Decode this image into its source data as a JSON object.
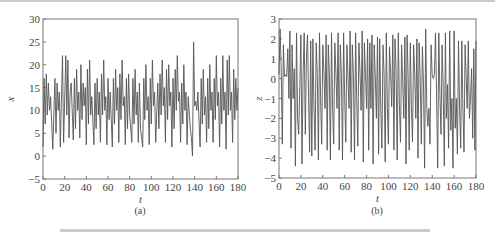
{
  "chart_data": [
    {
      "type": "line",
      "panel_label": "(a)",
      "xlabel": "t",
      "ylabel": "x",
      "xlim": [
        0,
        180
      ],
      "ylim": [
        -5,
        30
      ],
      "xticks": [
        0,
        20,
        40,
        60,
        80,
        100,
        120,
        140,
        160,
        180
      ],
      "yticks": [
        -5,
        0,
        5,
        10,
        15,
        20,
        25,
        30
      ],
      "grid": false,
      "series": [
        {
          "name": "x(t)",
          "t": [
            0,
            1,
            2,
            3,
            4,
            5,
            6,
            7,
            9,
            11,
            12,
            13,
            14,
            15,
            16,
            17,
            18,
            19,
            21,
            22,
            23,
            24,
            25,
            26,
            28,
            29,
            30,
            31,
            32,
            33,
            34,
            35,
            36,
            37,
            38,
            39,
            40,
            41,
            42,
            43,
            44,
            45,
            47,
            48,
            49,
            50,
            51,
            52,
            53,
            54,
            55,
            56,
            57,
            58,
            59,
            60,
            61,
            62,
            64,
            65,
            66,
            67,
            68,
            69,
            70,
            71,
            72,
            73,
            74,
            75,
            76,
            77,
            78,
            79,
            80,
            82,
            83,
            84,
            85,
            86,
            87,
            88,
            89,
            90,
            92,
            93,
            94,
            95,
            96,
            97,
            98,
            99,
            100,
            101,
            102,
            103,
            104,
            106,
            107,
            108,
            109,
            110,
            111,
            112,
            113,
            114,
            115,
            116,
            117,
            118,
            119,
            120,
            121,
            122,
            123,
            124,
            125,
            126,
            127,
            128,
            129,
            130,
            131,
            132,
            133,
            134,
            136,
            137,
            138,
            139,
            140,
            141,
            142,
            143,
            145,
            146,
            147,
            148,
            149,
            150,
            151,
            152,
            153,
            154,
            155,
            156,
            157,
            158,
            159,
            160,
            161,
            162,
            163,
            164,
            165,
            166,
            167,
            168,
            169,
            170,
            171,
            172,
            173,
            174,
            175,
            176,
            177,
            178,
            179,
            180
          ],
          "values": [
            2,
            17,
            7,
            18,
            9,
            16,
            10,
            13,
            1.5,
            17,
            5,
            16,
            10,
            14,
            2,
            12,
            22,
            3,
            22,
            9,
            21,
            4,
            14,
            16,
            3.5,
            17,
            6,
            19,
            10,
            14,
            4,
            20,
            8,
            16,
            11,
            15,
            2.5,
            19,
            7,
            21,
            9,
            13,
            2.5,
            16,
            6,
            17,
            9,
            14,
            3,
            18,
            9,
            21,
            10,
            13,
            2.5,
            17,
            8,
            14,
            2,
            17,
            7,
            19,
            10,
            15,
            3,
            18,
            8,
            21,
            11,
            13,
            2.5,
            17,
            6,
            18,
            9,
            3,
            17,
            7,
            19,
            9,
            14,
            3,
            16,
            6,
            2,
            17,
            8,
            20,
            10,
            13,
            2.5,
            17,
            7,
            21,
            11,
            14,
            3,
            16,
            6,
            18,
            9,
            21,
            11,
            15,
            3,
            19,
            8,
            20,
            11,
            14,
            2,
            17,
            6,
            19,
            10,
            22,
            12,
            14,
            3,
            16,
            7,
            20,
            10,
            14,
            2.5,
            13,
            6,
            4,
            0,
            25,
            11,
            12,
            10,
            14,
            2,
            17,
            7,
            19,
            9,
            13,
            3,
            17,
            6,
            20,
            10,
            14,
            3,
            17,
            8,
            22,
            11,
            14,
            2,
            17,
            7,
            22,
            10,
            14,
            1.5,
            21,
            9,
            22,
            10,
            14,
            3,
            19,
            8,
            17,
            10,
            15,
            5
          ]
        }
      ]
    },
    {
      "type": "line",
      "panel_label": "(b)",
      "xlabel": "t",
      "ylabel": "z",
      "xlim": [
        0,
        180
      ],
      "ylim": [
        -5,
        3
      ],
      "xticks": [
        0,
        20,
        40,
        60,
        80,
        100,
        120,
        140,
        160,
        180
      ],
      "yticks": [
        -5,
        -4,
        -3,
        -2,
        -1,
        0,
        1,
        2,
        3
      ],
      "grid": false,
      "series": [
        {
          "name": "z(t)",
          "t": [
            0,
            1,
            2,
            3,
            4,
            5,
            6,
            7,
            8,
            9,
            10,
            11,
            12,
            13,
            14,
            15,
            16,
            17,
            18,
            19,
            20,
            21,
            22,
            23,
            24,
            25,
            26,
            27,
            28,
            29,
            30,
            31,
            32,
            33,
            34,
            35,
            36,
            37,
            38,
            39,
            40,
            41,
            42,
            43,
            44,
            45,
            46,
            47,
            48,
            49,
            50,
            51,
            52,
            53,
            54,
            55,
            56,
            57,
            58,
            59,
            60,
            61,
            62,
            63,
            64,
            65,
            66,
            67,
            68,
            69,
            70,
            71,
            72,
            73,
            74,
            75,
            76,
            77,
            78,
            79,
            80,
            81,
            82,
            83,
            84,
            85,
            86,
            87,
            88,
            89,
            90,
            91,
            92,
            93,
            94,
            95,
            96,
            97,
            98,
            99,
            100,
            101,
            102,
            103,
            104,
            105,
            106,
            107,
            108,
            109,
            110,
            111,
            112,
            113,
            114,
            115,
            116,
            117,
            118,
            119,
            120,
            121,
            122,
            123,
            124,
            125,
            126,
            127,
            128,
            129,
            130,
            131,
            132,
            133,
            134,
            135,
            136,
            137,
            138,
            139,
            140,
            141,
            142,
            143,
            144,
            145,
            146,
            147,
            148,
            149,
            150,
            151,
            152,
            153,
            154,
            155,
            156,
            157,
            158,
            159,
            160,
            161,
            162,
            163,
            164,
            165,
            166,
            167,
            168,
            169,
            170,
            171,
            172,
            173,
            174,
            175,
            176,
            177,
            178,
            179,
            180
          ],
          "values": [
            0.2,
            2.5,
            0.5,
            -3.3,
            1.7,
            0.1,
            0.2,
            0.1,
            1.5,
            -1,
            2.4,
            -3.5,
            1.7,
            -1,
            0.5,
            -4.4,
            2.3,
            -2,
            -2.8,
            -0.4,
            2.2,
            -4.3,
            0.2,
            2.3,
            -2.8,
            1,
            2.2,
            -1,
            -3.7,
            1.9,
            -3.9,
            2,
            -1.5,
            -3.6,
            1.8,
            0.2,
            -4.1,
            2.3,
            -1,
            -3.3,
            1.7,
            0.3,
            -1.5,
            2.2,
            -3.6,
            1.7,
            0.3,
            -4.1,
            2.3,
            -1.5,
            -3.3,
            1.8,
            0.3,
            -1.5,
            2.3,
            -3.6,
            1.7,
            0.2,
            -4.1,
            2.3,
            -1,
            -3.2,
            1.7,
            0.2,
            -1.5,
            2.4,
            -3.7,
            1.7,
            0.2,
            -4.1,
            2.3,
            -1,
            -3.4,
            1.8,
            0.3,
            -1.6,
            2.4,
            -4.2,
            1.8,
            0.2,
            -1.5,
            2.0,
            -3.6,
            1.8,
            -1.5,
            2.2,
            -4.3,
            1.7,
            0.1,
            -2,
            2.1,
            -3.8,
            2.0,
            -1.5,
            -3.5,
            1.7,
            0.2,
            -4.2,
            2.3,
            -1.5,
            -3.3,
            1.6,
            0.3,
            -1.4,
            2.2,
            -3.6,
            2.0,
            0.3,
            -4.1,
            2.3,
            -1.3,
            -3.2,
            1.7,
            -0.1,
            -2.0,
            2.1,
            -4.3,
            2.2,
            0.2,
            -3.6,
            1.8,
            -1.4,
            -3.2,
            1.7,
            0.3,
            -2,
            2.0,
            -4.0,
            1.8,
            0.1,
            -3.3,
            1.6,
            -0.3,
            -4.5,
            2.5,
            -1.5,
            -2.4,
            -1.5,
            -3.3,
            1.7,
            0.2,
            0.0,
            0.2,
            2.3,
            -1,
            -4.5,
            2.3,
            -0.8,
            -2.8,
            1.7,
            -0.5,
            -4.4,
            2.3,
            -2.0,
            -0.3,
            -3.5,
            2.4,
            -2.6,
            -1.0,
            -4.5,
            2.4,
            -2.5,
            -1.0,
            -3.8,
            1.9,
            -1.5,
            -3.5,
            1.9,
            -1.5,
            -3.7,
            1.7,
            0.2,
            -1.5,
            1.9,
            -2,
            -1,
            0.5,
            -3.0,
            1.5,
            -3.6,
            1.9,
            0.2,
            -3.5,
            1.0,
            0.0
          ]
        }
      ]
    }
  ]
}
